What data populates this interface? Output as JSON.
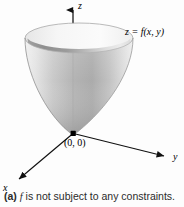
{
  "figure": {
    "background_color": "#fdfdfd",
    "axes": {
      "z_label": "z",
      "y_label": "y",
      "x_label": "x",
      "axis_color": "#111111"
    },
    "annotations": {
      "surface_label": "z = f(x, y)",
      "origin_label": "(0, 0)"
    },
    "surface": {
      "name": "paraboloid",
      "outer_light": "#e9e9e9",
      "outer_mid": "#b9b9b9",
      "outer_dark": "#9a9a9a",
      "inner_dark": "#8f8f8f",
      "inner_light": "#e4e4e4",
      "rim_color": "#f4f4f4",
      "outline_color": "#8a8a8a",
      "vertex_dot_color": "#000000"
    }
  },
  "caption": {
    "tag": "(a)",
    "italic_symbol": "f",
    "text": "is not subject to any constraints."
  }
}
